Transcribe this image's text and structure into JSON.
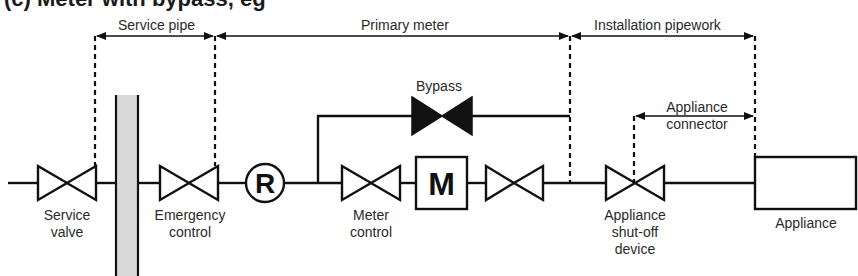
{
  "title": {
    "text": "(c) Meter with bypass, eg"
  },
  "colors": {
    "line": "#111111",
    "wall_fill": "#d9d9d9",
    "text": "#2a2a2a"
  },
  "zones": {
    "service_pipe": "Service pipe",
    "primary_meter": "Primary meter",
    "installation_pipework": "Installation pipework",
    "appliance_connector_line1": "Appliance",
    "appliance_connector_line2": "connector"
  },
  "components": {
    "service_valve": {
      "line1": "Service",
      "line2": "valve"
    },
    "emergency_control": {
      "line1": "Emergency",
      "line2": "control"
    },
    "regulator": {
      "symbol": "R"
    },
    "meter_control": {
      "line1": "Meter",
      "line2": "control"
    },
    "meter": {
      "symbol": "M"
    },
    "bypass": {
      "label": "Bypass"
    },
    "appliance_shutoff": {
      "line1": "Appliance",
      "line2": "shut-off",
      "line3": "device"
    },
    "appliance": {
      "label": "Appliance"
    }
  }
}
